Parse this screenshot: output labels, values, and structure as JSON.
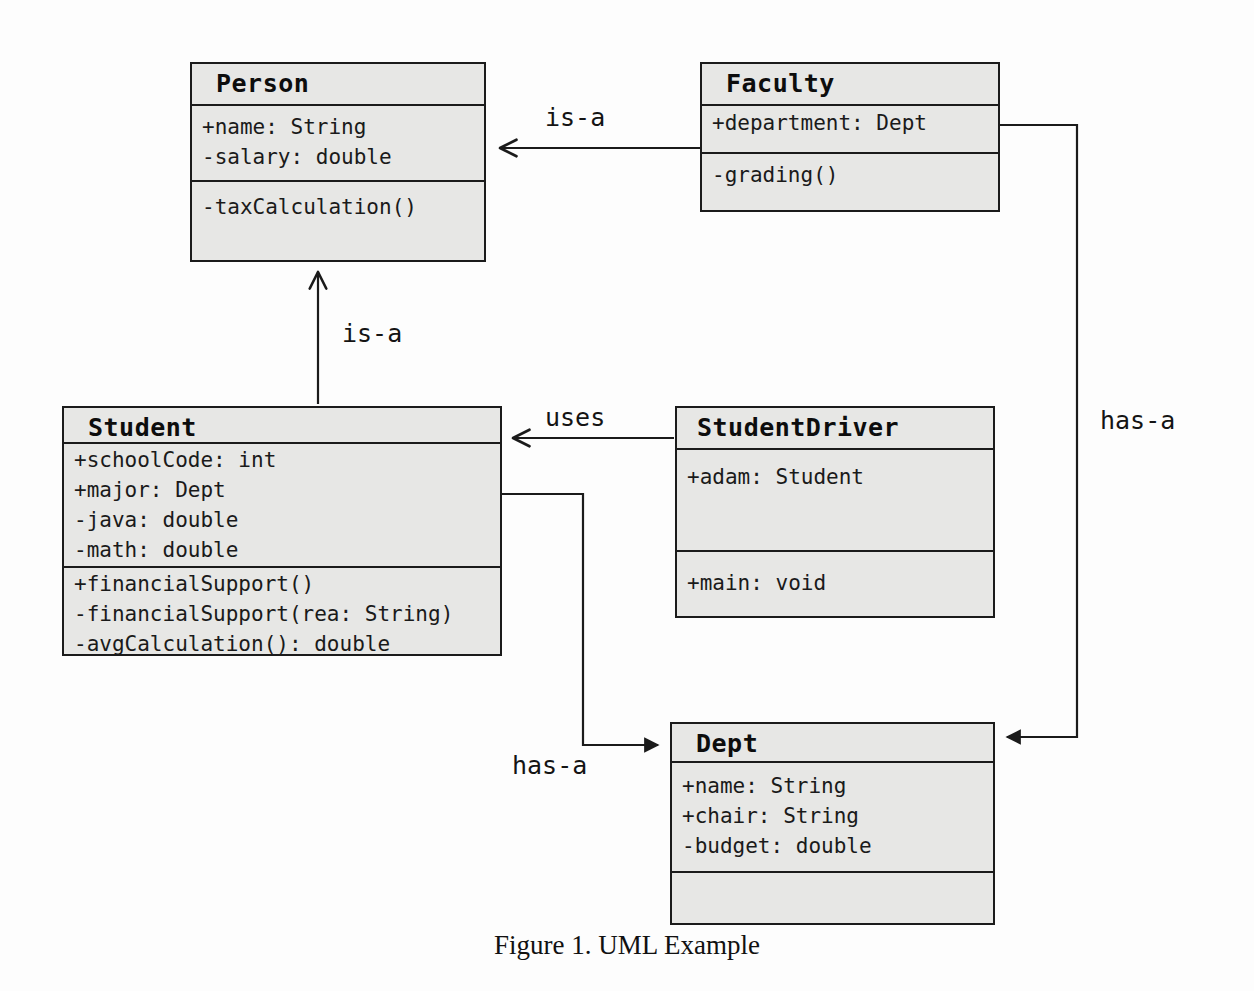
{
  "figure": {
    "caption": "Figure 1. UML Example",
    "background_color": "#fdfdfd",
    "class_fill_color": "#e7e7e5",
    "line_color": "#1b1b1b"
  },
  "classes": [
    {
      "id": "person",
      "name": "Person",
      "attributes": [
        "+name: String",
        "-salary: double"
      ],
      "methods": [
        "-taxCalculation()"
      ]
    },
    {
      "id": "faculty",
      "name": "Faculty",
      "attributes": [
        "+department: Dept"
      ],
      "methods": [
        "-grading()"
      ]
    },
    {
      "id": "student",
      "name": "Student",
      "attributes": [
        "+schoolCode: int",
        "+major: Dept",
        "-java: double",
        "-math: double"
      ],
      "methods": [
        "+financialSupport()",
        "-financialSupport(rea: String)",
        "-avgCalculation(): double"
      ]
    },
    {
      "id": "studentdriver",
      "name": "StudentDriver",
      "attributes": [
        "+adam: Student"
      ],
      "methods": [
        "+main: void"
      ]
    },
    {
      "id": "dept",
      "name": "Dept",
      "attributes": [
        "+name: String",
        "+chair: String",
        "-budget: double"
      ],
      "methods": []
    }
  ],
  "relationships": [
    {
      "id": "faculty-is-a-person",
      "label": "is-a",
      "from": "faculty",
      "to": "person",
      "kind": "inheritance"
    },
    {
      "id": "student-is-a-person",
      "label": "is-a",
      "from": "student",
      "to": "person",
      "kind": "inheritance"
    },
    {
      "id": "studentdriver-uses-student",
      "label": "uses",
      "from": "studentdriver",
      "to": "student",
      "kind": "dependency"
    },
    {
      "id": "faculty-has-a-dept",
      "label": "has-a",
      "from": "faculty",
      "to": "dept",
      "kind": "association"
    },
    {
      "id": "student-has-a-dept",
      "label": "has-a",
      "from": "student",
      "to": "dept",
      "kind": "association"
    }
  ]
}
